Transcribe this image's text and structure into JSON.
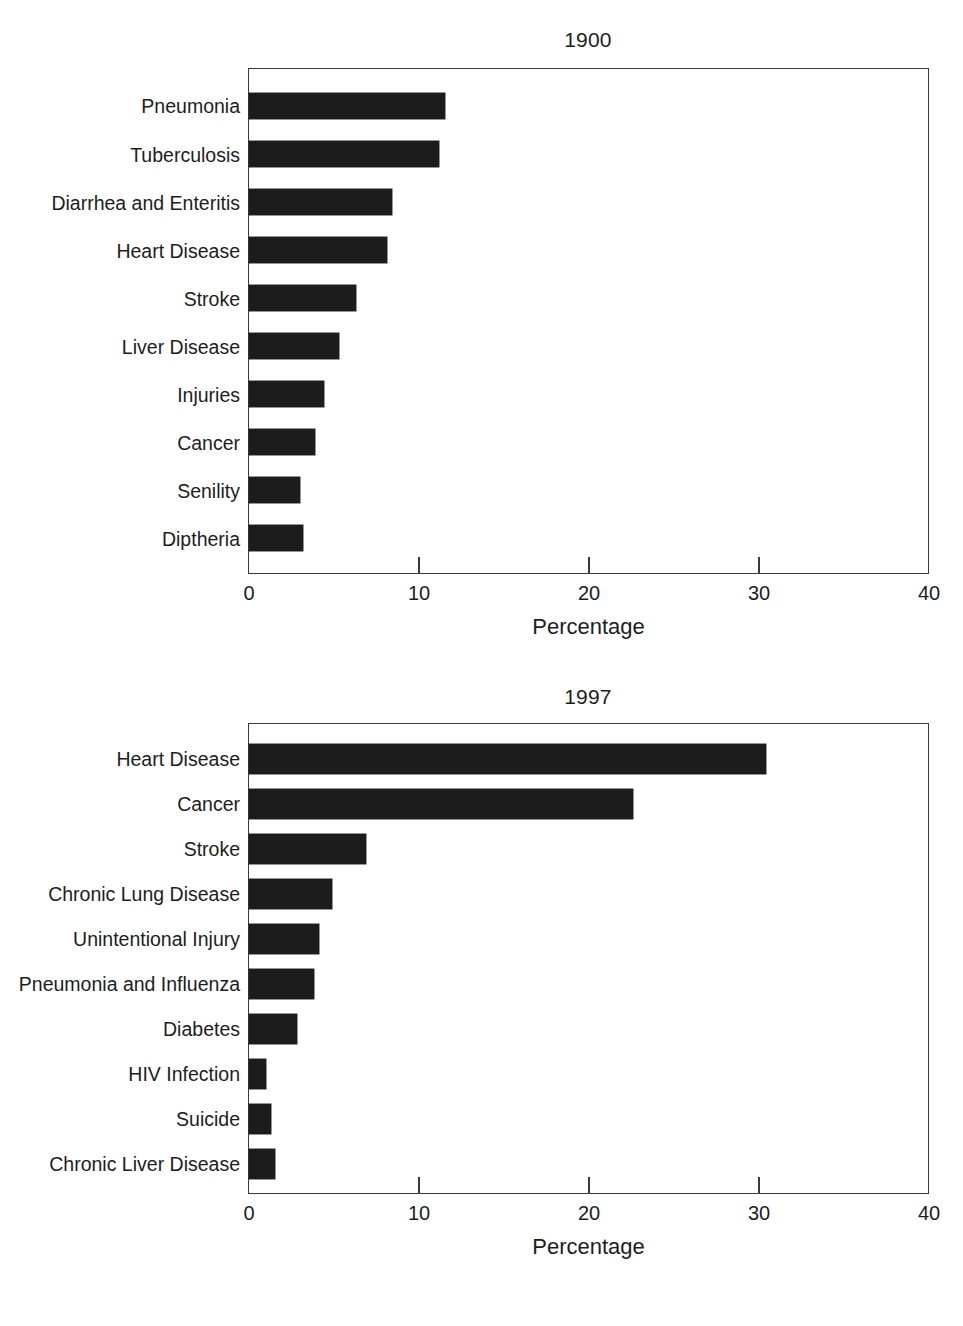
{
  "chart_data": [
    {
      "type": "bar",
      "orientation": "horizontal",
      "title": "1900",
      "xlabel": "Percentage",
      "ylabel": "",
      "xlim": [
        0,
        40
      ],
      "xticks": [
        "0",
        "10",
        "20",
        "30",
        "40"
      ],
      "grid": false,
      "legend": "none",
      "bar_color": "#1c1c1c",
      "categories": [
        "Pneumonia",
        "Tuberculosis",
        "Diarrhea and Enteritis",
        "Heart Disease",
        "Stroke",
        "Liver Disease",
        "Injuries",
        "Cancer",
        "Senility",
        "Diptheria"
      ],
      "values": [
        11.5,
        11.2,
        8.4,
        8.1,
        6.3,
        5.3,
        4.4,
        3.9,
        3.0,
        3.2
      ]
    },
    {
      "type": "bar",
      "orientation": "horizontal",
      "title": "1997",
      "xlabel": "Percentage",
      "ylabel": "",
      "xlim": [
        0,
        40
      ],
      "xticks": [
        "0",
        "10",
        "20",
        "30",
        "40"
      ],
      "grid": false,
      "legend": "none",
      "bar_color": "#1c1c1c",
      "categories": [
        "Heart Disease",
        "Cancer",
        "Stroke",
        "Chronic Lung Disease",
        "Unintentional Injury",
        "Pneumonia and Influenza",
        "Diabetes",
        "HIV Infection",
        "Suicide",
        "Chronic Liver Disease"
      ],
      "values": [
        30.4,
        22.6,
        6.9,
        4.9,
        4.1,
        3.8,
        2.8,
        1.0,
        1.3,
        1.5
      ]
    }
  ]
}
